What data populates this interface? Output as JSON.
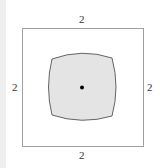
{
  "diagram": {
    "outer_square": {
      "side_label_top": "2",
      "side_label_bottom": "2",
      "side_label_left": "2",
      "side_label_right": "2",
      "stroke": "#999999"
    },
    "inner_region": {
      "fill": "#e6e6e6",
      "stroke": "#555555",
      "shape": "curvilinear square (bulging sides)"
    },
    "center_point": {
      "color": "#000000"
    }
  }
}
